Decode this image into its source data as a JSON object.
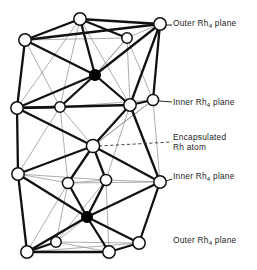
{
  "figure": {
    "clipped_header_text": "",
    "type": "molecular-cluster-polyhedron",
    "colors": {
      "line": "#111111",
      "faint_line": "#8d8d8d",
      "vertex_fill": "#ffffff",
      "vertex_stroke": "#111111",
      "interstitial_fill": "#000000",
      "background": "#ffffff",
      "label_text": "#1d1d1d"
    }
  },
  "labels": {
    "outer_top": {
      "text": "Outer Rh",
      "sub": "4",
      "tail": " plane"
    },
    "inner_top": {
      "text": "Inner Rh",
      "sub": "4",
      "tail": " plane"
    },
    "encapsulated": {
      "line1": "Encapsulated",
      "line2": "Rh atom"
    },
    "inner_bottom": {
      "text": "Inner Rh",
      "sub": "4",
      "tail": " plane"
    },
    "outer_bottom": {
      "text": "Outer Rh",
      "sub": "4",
      "tail": " plane"
    }
  },
  "chart_data": {
    "type": "scatter",
    "title": "",
    "xlabel": "",
    "ylabel": "",
    "xlim": [
      0,
      257
    ],
    "ylim": [
      0,
      270
    ],
    "grid": false,
    "legend": [
      "Outer Rh4 plane",
      "Inner Rh4 plane",
      "Encapsulated Rh atom"
    ],
    "atoms": [
      {
        "id": "A1",
        "x": 25,
        "y": 40,
        "kind": "open",
        "r": 6.2,
        "group": "outer_top"
      },
      {
        "id": "A2",
        "x": 80,
        "y": 19,
        "kind": "open",
        "r": 6.2,
        "group": "outer_top"
      },
      {
        "id": "A3",
        "x": 127,
        "y": 38,
        "kind": "open",
        "r": 5.2,
        "group": "outer_top"
      },
      {
        "id": "A4",
        "x": 160,
        "y": 24,
        "kind": "open",
        "r": 6.2,
        "group": "outer_top"
      },
      {
        "id": "B1",
        "x": 95,
        "y": 75,
        "kind": "filled",
        "r": 5.4,
        "group": "interstitial_top"
      },
      {
        "id": "C1",
        "x": 17,
        "y": 108,
        "kind": "open",
        "r": 6.2,
        "group": "inner_top"
      },
      {
        "id": "C2",
        "x": 60,
        "y": 107,
        "kind": "open",
        "r": 5.2,
        "group": "inner_top"
      },
      {
        "id": "C3",
        "x": 130,
        "y": 105,
        "kind": "open",
        "r": 6.2,
        "group": "inner_top"
      },
      {
        "id": "C4",
        "x": 153,
        "y": 100,
        "kind": "open",
        "r": 5.6,
        "group": "inner_top"
      },
      {
        "id": "D1",
        "x": 93,
        "y": 146,
        "kind": "open",
        "r": 6.6,
        "group": "encapsulated"
      },
      {
        "id": "E1",
        "x": 18,
        "y": 174,
        "kind": "open",
        "r": 6.2,
        "group": "inner_bottom"
      },
      {
        "id": "E2",
        "x": 68,
        "y": 183,
        "kind": "open",
        "r": 5.6,
        "group": "inner_bottom"
      },
      {
        "id": "E3",
        "x": 106,
        "y": 180,
        "kind": "open",
        "r": 5.6,
        "group": "inner_bottom"
      },
      {
        "id": "E4",
        "x": 160,
        "y": 182,
        "kind": "open",
        "r": 6.2,
        "group": "inner_bottom"
      },
      {
        "id": "F1",
        "x": 87,
        "y": 217,
        "kind": "filled",
        "r": 5.4,
        "group": "interstitial_bottom"
      },
      {
        "id": "G1",
        "x": 27,
        "y": 252,
        "kind": "open",
        "r": 6.2,
        "group": "outer_bottom"
      },
      {
        "id": "G2",
        "x": 56,
        "y": 242,
        "kind": "open",
        "r": 5.2,
        "group": "outer_bottom"
      },
      {
        "id": "G3",
        "x": 109,
        "y": 252,
        "kind": "open",
        "r": 6.2,
        "group": "outer_bottom"
      },
      {
        "id": "G4",
        "x": 139,
        "y": 243,
        "kind": "open",
        "r": 6.2,
        "group": "outer_bottom"
      }
    ],
    "bonds_heavy": [
      [
        "A1",
        "A2"
      ],
      [
        "A2",
        "A4"
      ],
      [
        "A1",
        "A4"
      ],
      [
        "A2",
        "A3"
      ],
      [
        "A1",
        "B1"
      ],
      [
        "A2",
        "B1"
      ],
      [
        "A4",
        "B1"
      ],
      [
        "A1",
        "C1"
      ],
      [
        "A4",
        "C3"
      ],
      [
        "A4",
        "C4"
      ],
      [
        "B1",
        "C1"
      ],
      [
        "B1",
        "C3"
      ],
      [
        "B1",
        "C2"
      ],
      [
        "C1",
        "C3"
      ],
      [
        "C1",
        "C2"
      ],
      [
        "C3",
        "C4"
      ],
      [
        "C1",
        "E1"
      ],
      [
        "C3",
        "E4"
      ],
      [
        "C3",
        "D1"
      ],
      [
        "C1",
        "D1"
      ],
      [
        "D1",
        "E2"
      ],
      [
        "D1",
        "E3"
      ],
      [
        "D1",
        "E1"
      ],
      [
        "D1",
        "E4"
      ],
      [
        "E1",
        "F1"
      ],
      [
        "E4",
        "F1"
      ],
      [
        "E2",
        "F1"
      ],
      [
        "E3",
        "F1"
      ],
      [
        "F1",
        "G1"
      ],
      [
        "F1",
        "G3"
      ],
      [
        "F1",
        "G4"
      ],
      [
        "E1",
        "G1"
      ],
      [
        "E4",
        "G4"
      ],
      [
        "G1",
        "G3"
      ],
      [
        "G1",
        "G2"
      ],
      [
        "G3",
        "G4"
      ]
    ],
    "bonds_faint": [
      [
        "A1",
        "A3"
      ],
      [
        "A3",
        "A4"
      ],
      [
        "A3",
        "B1"
      ],
      [
        "A3",
        "C3"
      ],
      [
        "A3",
        "C4"
      ],
      [
        "A1",
        "C2"
      ],
      [
        "A2",
        "C2"
      ],
      [
        "A2",
        "C3"
      ],
      [
        "A2",
        "C1"
      ],
      [
        "C2",
        "C3"
      ],
      [
        "C2",
        "C4"
      ],
      [
        "C4",
        "C3"
      ],
      [
        "C2",
        "D1"
      ],
      [
        "C4",
        "D1"
      ],
      [
        "C2",
        "E1"
      ],
      [
        "C2",
        "E2"
      ],
      [
        "C3",
        "E3"
      ],
      [
        "C4",
        "E4"
      ],
      [
        "E1",
        "E2"
      ],
      [
        "E2",
        "E3"
      ],
      [
        "E3",
        "E4"
      ],
      [
        "E1",
        "E3"
      ],
      [
        "E2",
        "E4"
      ],
      [
        "E2",
        "G2"
      ],
      [
        "E3",
        "G2"
      ],
      [
        "E2",
        "G1"
      ],
      [
        "E3",
        "G3"
      ],
      [
        "F1",
        "G2"
      ],
      [
        "G2",
        "G3"
      ],
      [
        "G2",
        "G4"
      ],
      [
        "G1",
        "G4"
      ],
      [
        "B1",
        "A3"
      ],
      [
        "D1",
        "C4"
      ]
    ]
  }
}
